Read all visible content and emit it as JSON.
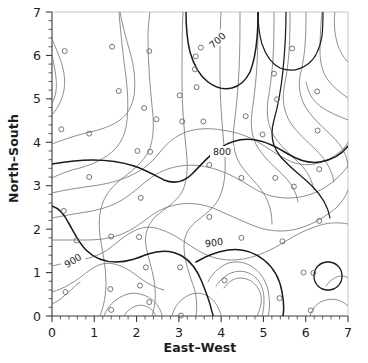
{
  "figure": {
    "type": "contour-plot",
    "background": "#ffffff",
    "width": 368,
    "height": 363
  },
  "axes": {
    "x": {
      "label": "East–West",
      "ticks": [
        "0",
        "1",
        "2",
        "3",
        "4",
        "5",
        "6",
        "7"
      ],
      "min": 0,
      "max": 7,
      "minor_tick_step": 0.2
    },
    "y": {
      "label": "North–South",
      "ticks": [
        "0",
        "1",
        "2",
        "3",
        "4",
        "5",
        "6",
        "7"
      ],
      "min": 0,
      "max": 7,
      "minor_tick_step": 0.2
    }
  },
  "style": {
    "axis_color": "#3a3a3a",
    "contour_minor_color": "#7a7a7a",
    "contour_major_color": "#1a1a1a",
    "marker_color": "#6e6e6e",
    "text_color": "#1c1c1c"
  },
  "chart_data": {
    "type": "contour",
    "title": "",
    "xlabel": "East–West",
    "ylabel": "North–South",
    "xlim": [
      0,
      7
    ],
    "ylim": [
      0,
      7
    ],
    "grid": false,
    "legend": "none",
    "contour_interval": 50,
    "labeled_levels": [
      700,
      800,
      900
    ],
    "level_labels": [
      {
        "text": "700",
        "x": 3.9,
        "y": 6.35,
        "rotation": -42
      },
      {
        "text": "800",
        "x": 3.55,
        "y": 3.78,
        "rotation": 0
      },
      {
        "text": "900",
        "x": 3.8,
        "y": 1.7,
        "rotation": -8
      },
      {
        "text": "900",
        "x": 0.45,
        "y": 1.15,
        "rotation": -30
      }
    ],
    "annotations": [
      "Elevation contours increase toward the south‐east, with a closed high near (4.1, 0.8)",
      "A broad low (700 ft) lies along the northern boundary near x = 3.5–4",
      "Small closed highs appear near (6.2, 1.0) and (6.1, 0.1)"
    ],
    "sample_points": [
      {
        "x": 0.3,
        "y": 6.1
      },
      {
        "x": 1.42,
        "y": 6.2
      },
      {
        "x": 2.3,
        "y": 6.1
      },
      {
        "x": 3.52,
        "y": 6.18
      },
      {
        "x": 5.68,
        "y": 6.16
      },
      {
        "x": 3.4,
        "y": 5.98
      },
      {
        "x": 3.38,
        "y": 5.68
      },
      {
        "x": 3.42,
        "y": 5.27
      },
      {
        "x": 5.25,
        "y": 5.58
      },
      {
        "x": 1.58,
        "y": 5.18
      },
      {
        "x": 3.02,
        "y": 5.08
      },
      {
        "x": 6.27,
        "y": 5.17
      },
      {
        "x": 5.32,
        "y": 4.99
      },
      {
        "x": 2.18,
        "y": 4.79
      },
      {
        "x": 2.47,
        "y": 4.53
      },
      {
        "x": 3.08,
        "y": 4.48
      },
      {
        "x": 3.58,
        "y": 4.48
      },
      {
        "x": 4.58,
        "y": 4.6
      },
      {
        "x": 0.22,
        "y": 4.3
      },
      {
        "x": 0.88,
        "y": 4.2
      },
      {
        "x": 4.98,
        "y": 4.18
      },
      {
        "x": 6.28,
        "y": 4.27
      },
      {
        "x": 2.02,
        "y": 3.8
      },
      {
        "x": 2.32,
        "y": 3.78
      },
      {
        "x": 3.72,
        "y": 3.48
      },
      {
        "x": 6.32,
        "y": 3.38
      },
      {
        "x": 0.88,
        "y": 3.2
      },
      {
        "x": 4.48,
        "y": 3.18
      },
      {
        "x": 5.28,
        "y": 3.18
      },
      {
        "x": 5.72,
        "y": 2.98
      },
      {
        "x": 2.1,
        "y": 2.72
      },
      {
        "x": 0.28,
        "y": 2.42
      },
      {
        "x": 3.72,
        "y": 2.28
      },
      {
        "x": 6.32,
        "y": 2.19
      },
      {
        "x": 0.58,
        "y": 1.74
      },
      {
        "x": 1.4,
        "y": 1.83
      },
      {
        "x": 2.06,
        "y": 1.82
      },
      {
        "x": 4.48,
        "y": 1.8
      },
      {
        "x": 5.45,
        "y": 1.72
      },
      {
        "x": 2.22,
        "y": 1.12
      },
      {
        "x": 3.03,
        "y": 1.12
      },
      {
        "x": 5.95,
        "y": 1.0
      },
      {
        "x": 6.18,
        "y": 0.99
      },
      {
        "x": 4.08,
        "y": 0.82
      },
      {
        "x": 0.32,
        "y": 0.55
      },
      {
        "x": 1.38,
        "y": 0.62
      },
      {
        "x": 2.08,
        "y": 0.7
      },
      {
        "x": 2.3,
        "y": 0.32
      },
      {
        "x": 5.38,
        "y": 0.41
      },
      {
        "x": 6.12,
        "y": 0.13
      },
      {
        "x": 1.4,
        "y": 0.14
      },
      {
        "x": 3.05,
        "y": 0.01
      }
    ]
  }
}
